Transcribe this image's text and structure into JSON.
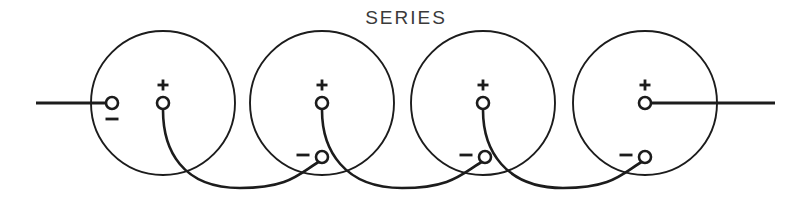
{
  "diagram": {
    "title": "SERIES",
    "type": "battery-series-wiring",
    "canvas": {
      "width": 804,
      "height": 207
    },
    "colors": {
      "background": "#ffffff",
      "ink": "#1c1c1c",
      "title_ink": "#3a3a3a"
    },
    "title_position": {
      "x": 406,
      "y": 24
    },
    "cell_radius": 72,
    "cells": [
      {
        "index": 1,
        "center": {
          "x": 163,
          "y": 103
        },
        "terminals": [
          {
            "polarity": "-",
            "label": "−",
            "x": 112,
            "y": 103,
            "label_x": 112,
            "label_y": 119
          },
          {
            "polarity": "+",
            "label": "+",
            "x": 163,
            "y": 103,
            "label_x": 163,
            "label_y": 85
          }
        ]
      },
      {
        "index": 2,
        "center": {
          "x": 322,
          "y": 103
        },
        "terminals": [
          {
            "polarity": "+",
            "label": "+",
            "x": 322,
            "y": 103,
            "label_x": 322,
            "label_y": 85
          },
          {
            "polarity": "-",
            "label": "−",
            "x": 322,
            "y": 157,
            "label_x": 303,
            "label_y": 155
          }
        ]
      },
      {
        "index": 3,
        "center": {
          "x": 483,
          "y": 103
        },
        "terminals": [
          {
            "polarity": "+",
            "label": "+",
            "x": 483,
            "y": 103,
            "label_x": 483,
            "label_y": 85
          },
          {
            "polarity": "-",
            "label": "−",
            "x": 485,
            "y": 157,
            "label_x": 466,
            "label_y": 155
          }
        ]
      },
      {
        "index": 4,
        "center": {
          "x": 645,
          "y": 103
        },
        "terminals": [
          {
            "polarity": "+",
            "label": "+",
            "x": 645,
            "y": 103,
            "label_x": 645,
            "label_y": 85
          },
          {
            "polarity": "-",
            "label": "−",
            "x": 645,
            "y": 157,
            "label_x": 626,
            "label_y": 155
          }
        ]
      }
    ],
    "leads": [
      {
        "name": "left-lead",
        "x1": 36,
        "y1": 103,
        "x2": 112,
        "y2": 103
      },
      {
        "name": "right-lead",
        "x1": 645,
        "y1": 103,
        "x2": 775,
        "y2": 103
      }
    ],
    "link_wires": [
      {
        "name": "link-1-2",
        "from_cell": 1,
        "to_cell": 2,
        "path": "M163,110 C163,150 182,188 240,188 C292,188 300,172 322,160"
      },
      {
        "name": "link-2-3",
        "from_cell": 2,
        "to_cell": 3,
        "path": "M322,110 C322,150 344,188 402,188 C454,188 463,172 485,160"
      },
      {
        "name": "link-3-4",
        "from_cell": 3,
        "to_cell": 4,
        "path": "M483,110 C483,150 505,188 563,188 C615,188 623,172 645,160"
      }
    ],
    "notes": {
      "terminal_radius": 6,
      "sign_plus_size": 11,
      "sign_minus_width": 13
    }
  }
}
